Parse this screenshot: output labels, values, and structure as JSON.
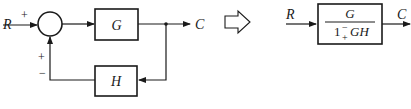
{
  "diagram": {
    "type": "block-diagram",
    "left": {
      "input_label": "R",
      "output_label": "C",
      "input_sign": "+",
      "feedback_sign_top": "+",
      "feedback_sign_bottom": "−",
      "forward_block": "G",
      "feedback_block": "H"
    },
    "equivalence_arrow": "hollow-right-arrow",
    "right": {
      "input_label": "R",
      "output_label": "C",
      "numerator": "G",
      "denominator_one": "1",
      "denominator_sign_top": "−",
      "denominator_sign_bottom": "+",
      "denominator_term": "GH"
    },
    "colors": {
      "stroke": "#1a1a1a",
      "background": "#ffffff"
    }
  }
}
